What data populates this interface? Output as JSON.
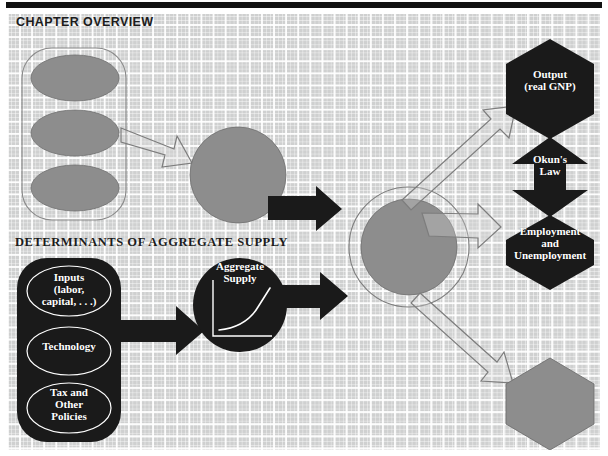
{
  "page": {
    "headings": {
      "chapter_overview": "CHAPTER OVERVIEW",
      "determinants": "DETERMINANTS OF AGGREGATE SUPPLY"
    },
    "colors": {
      "paper_bg": "#cfd0d0",
      "grid_line": "#ffffff",
      "shape_gray": "#8d8d8d",
      "shape_black": "#1a1a1a",
      "outline_gray": "#7d7d7d",
      "label_text": "#ffffff",
      "heading_text": "#1c1c1c",
      "top_rule": "#111111"
    }
  },
  "overview_group": {
    "name": "determinants-of-aggregate-demand-group",
    "container_label": "",
    "ellipses": [
      {
        "label": ""
      },
      {
        "label": ""
      },
      {
        "label": ""
      }
    ]
  },
  "supply_group": {
    "name": "determinants-of-aggregate-supply-group",
    "ellipses": [
      {
        "label": "Inputs\n(labor,\ncapital, . . .)"
      },
      {
        "label": "Technology"
      },
      {
        "label": "Tax and\nOther\nPolicies"
      }
    ]
  },
  "nodes": {
    "aggregate_demand_circle": {
      "label": ""
    },
    "aggregate_supply_circle": {
      "label": "Aggregate\nSupply",
      "has_inset_chart": true
    },
    "equilibrium_circle": {
      "label": ""
    },
    "output_hexagon": {
      "label": "Output\n(real GNP)"
    },
    "okun_arrow": {
      "label": "Okun's\nLaw"
    },
    "employment_hexagon": {
      "label": "Employment\nand\nUnemployment"
    },
    "price_hexagon": {
      "label": ""
    }
  },
  "inset_chart": {
    "type": "line",
    "title": "Aggregate Supply",
    "xlabel": "",
    "ylabel": "",
    "x": [
      0,
      1,
      2,
      3,
      4,
      5,
      6,
      7,
      8,
      9,
      10
    ],
    "y": [
      2,
      2.2,
      2.5,
      3.0,
      3.8,
      4.8,
      6.2,
      8.0,
      10.2,
      13.0,
      16.0
    ],
    "xlim": [
      0,
      10
    ],
    "ylim": [
      0,
      18
    ],
    "grid": false,
    "legend": null,
    "axis_color": "#ffffff",
    "curve_color": "#ffffff",
    "note": "upward-sloping convex aggregate supply curve drawn inside the black circle"
  },
  "arrows": [
    {
      "name": "overview-ellipses-to-demand-circle",
      "style": "outlined",
      "from": "overview_group",
      "to": "aggregate_demand_circle"
    },
    {
      "name": "demand-circle-to-equilibrium-circle",
      "style": "outlined",
      "from": "aggregate_demand_circle",
      "to": "equilibrium_circle"
    },
    {
      "name": "supply-ellipses-to-supply-circle",
      "style": "solid-black",
      "from": "supply_group",
      "to": "aggregate_supply_circle"
    },
    {
      "name": "supply-circle-to-equilibrium-circle",
      "style": "solid-black",
      "from": "aggregate_supply_circle",
      "to": "equilibrium_circle"
    },
    {
      "name": "equilibrium-to-output-hexagon",
      "style": "outlined",
      "from": "equilibrium_circle",
      "to": "output_hexagon"
    },
    {
      "name": "equilibrium-to-employment-hexagon",
      "style": "outlined",
      "from": "equilibrium_circle",
      "to": "employment_hexagon"
    },
    {
      "name": "equilibrium-to-price-hexagon",
      "style": "outlined",
      "from": "equilibrium_circle",
      "to": "price_hexagon"
    }
  ]
}
